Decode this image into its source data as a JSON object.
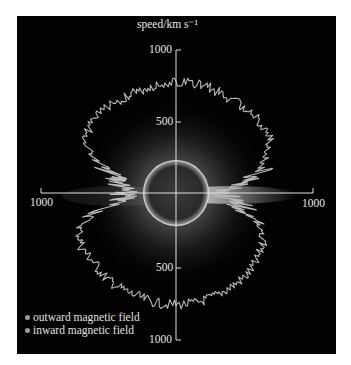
{
  "chart_data": {
    "type": "polar-line",
    "title": "",
    "radial_axis_label": "speed/km s−1",
    "radial_ticks": [
      {
        "value": 1000,
        "position": "top"
      },
      {
        "value": 500,
        "position": "top"
      },
      {
        "value": 500,
        "position": "bottom"
      },
      {
        "value": 1000,
        "position": "bottom"
      },
      {
        "value": 1000,
        "position": "left"
      },
      {
        "value": 1000,
        "position": "right"
      }
    ],
    "rmax": 1000,
    "background": "solar corona image with dark solar disk at centre",
    "legend": [
      {
        "label": "outward magnetic field",
        "color": "#9a9a9a"
      },
      {
        "label": "inward magnetic field",
        "color": "#9a9a9a"
      }
    ],
    "series": [
      {
        "name": "solar wind speed vs heliolatitude",
        "note": "angle in degrees measured counter-clockwise from right-hand horizontal axis; speed in km/s",
        "angle_deg": [
          20,
          30,
          40,
          50,
          60,
          70,
          80,
          90,
          100,
          110,
          120,
          130,
          140,
          150,
          160,
          165,
          170,
          175,
          180,
          185,
          190,
          195,
          200,
          210,
          220,
          230,
          240,
          250,
          260,
          270,
          280,
          290,
          300,
          310,
          320,
          330,
          340,
          345,
          350,
          355,
          0,
          5,
          10,
          15
        ],
        "speed": [
          650,
          760,
          770,
          760,
          760,
          770,
          780,
          780,
          770,
          760,
          760,
          770,
          760,
          740,
          560,
          430,
          400,
          380,
          370,
          380,
          420,
          600,
          720,
          760,
          750,
          770,
          770,
          770,
          780,
          780,
          780,
          770,
          760,
          760,
          740,
          700,
          600,
          500,
          450,
          380,
          350,
          380,
          550,
          600
        ]
      }
    ]
  },
  "labels": {
    "axis_title": "speed/km s⁻¹",
    "top_1000": "1000",
    "top_500": "500",
    "bottom_500": "500",
    "bottom_1000": "1000",
    "left_1000": "1000",
    "right_1000": "1000"
  },
  "legend": {
    "outward": "outward magnetic field",
    "inward": "inward magnetic field"
  }
}
